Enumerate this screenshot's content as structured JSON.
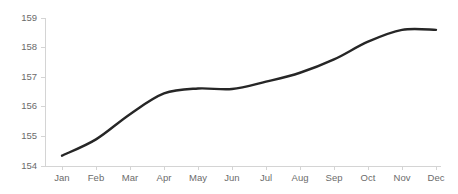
{
  "chart_data": {
    "type": "line",
    "title": "",
    "subtitle": "",
    "xlabel": "",
    "ylabel": "",
    "categories": [
      "Jan",
      "Feb",
      "Mar",
      "Apr",
      "May",
      "Jun",
      "Jul",
      "Aug",
      "Sep",
      "Oct",
      "Nov",
      "Dec"
    ],
    "series": [
      {
        "name": "",
        "values": [
          154.35,
          154.9,
          155.75,
          156.45,
          156.62,
          156.6,
          156.85,
          157.15,
          157.6,
          158.2,
          158.6,
          158.6
        ]
      }
    ],
    "ylim": [
      154,
      159
    ],
    "yticks": [
      154,
      155,
      156,
      157,
      158,
      159
    ],
    "ytick_labels": [
      "154",
      "155",
      "156",
      "157",
      "158",
      "159"
    ],
    "xtick_labels": [
      "Jan",
      "Feb",
      "Mar",
      "Apr",
      "May",
      "Jun",
      "Jul",
      "Aug",
      "Sep",
      "Oct",
      "Nov",
      "Dec"
    ],
    "grid": false,
    "legend": "none",
    "colors": {
      "line": "#262626",
      "axis": "#d4d4d4",
      "tick_label": "#6b6b6b",
      "background": "#ffffff"
    }
  }
}
